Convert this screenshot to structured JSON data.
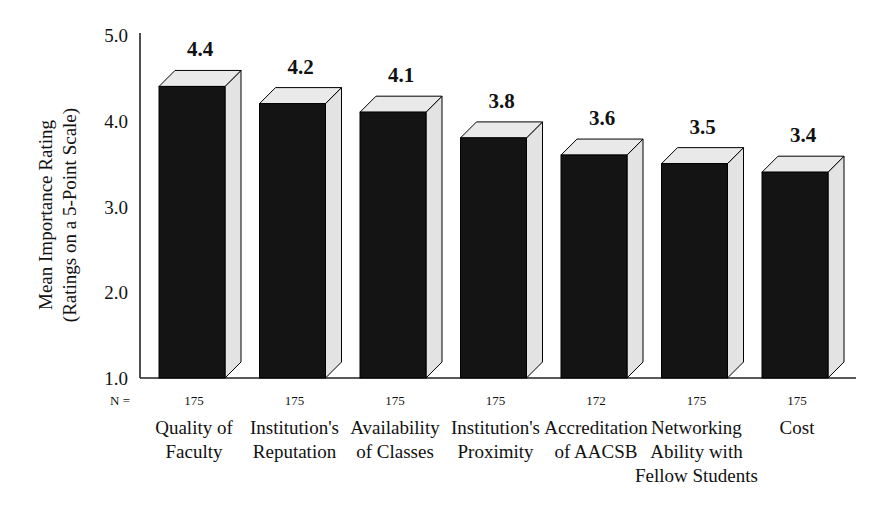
{
  "chart_data": {
    "type": "bar",
    "title": "",
    "xlabel": "",
    "ylabel": "Mean Importance Rating (Ratings on a 5-Point Scale)",
    "ylabel_line1": "Mean Importance Rating",
    "ylabel_line2": "(Ratings on a 5-Point Scale)",
    "ylim": [
      1.0,
      5.0
    ],
    "ytick_labels": [
      "5.0",
      "4.0",
      "3.0",
      "2.0",
      "1.0"
    ],
    "ytick_values": [
      5.0,
      4.0,
      3.0,
      2.0,
      1.0
    ],
    "grid": false,
    "legend": "none",
    "style": "3d-bar",
    "n_label": "N =",
    "categories": [
      "Quality of Faculty",
      "Institution's Reputation",
      "Availability of Classes",
      "Institution's Proximity",
      "Accreditation of AACSB",
      "Networking Ability with Fellow Students",
      "Cost"
    ],
    "category_lines": [
      [
        "Quality of",
        "Faculty"
      ],
      [
        "Institution's",
        "Reputation"
      ],
      [
        "Availability",
        "of Classes"
      ],
      [
        "Institution's",
        "Proximity"
      ],
      [
        "Accreditation",
        "of AACSB"
      ],
      [
        "Networking",
        "Ability with",
        "Fellow Students"
      ],
      [
        "Cost"
      ]
    ],
    "values": [
      4.4,
      4.2,
      4.1,
      3.8,
      3.6,
      3.5,
      3.4
    ],
    "value_labels": [
      "4.4",
      "4.2",
      "4.1",
      "3.8",
      "3.6",
      "3.5",
      "3.4"
    ],
    "n_values": [
      "175",
      "175",
      "175",
      "175",
      "172",
      "175",
      "175"
    ]
  },
  "colors": {
    "bar_front": "#141414",
    "bar_top": "#e9e9e9",
    "bar_side": "#e3e3e3",
    "axis": "#222222",
    "text": "#111111",
    "background": "#ffffff"
  }
}
